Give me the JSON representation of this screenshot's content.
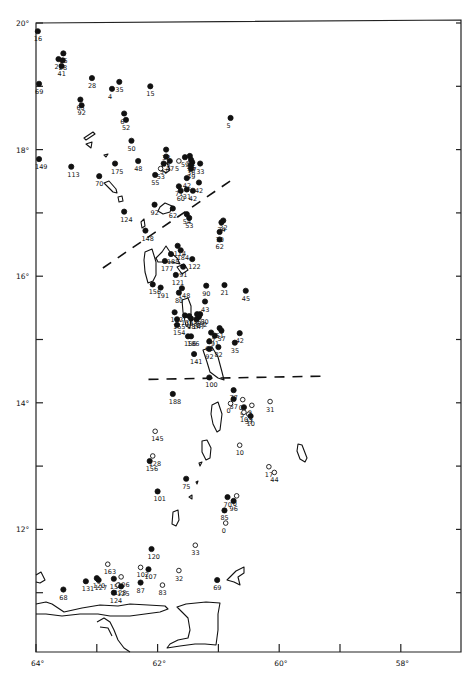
{
  "chart_data": {
    "type": "scatter",
    "title": "",
    "xlabel": "",
    "ylabel": "",
    "xlim": [
      -64,
      -57.1
    ],
    "ylim": [
      10.0,
      20.0
    ],
    "x_ticks": [
      -64,
      -63,
      -62,
      -61,
      -60,
      -59,
      -58
    ],
    "x_tick_labels": [
      {
        "value": -64,
        "label": "64°"
      },
      {
        "value": -62,
        "label": "62°"
      },
      {
        "value": -60,
        "label": "60°"
      },
      {
        "value": -58,
        "label": "58°"
      }
    ],
    "y_ticks": [
      20,
      19,
      18,
      17,
      16,
      15,
      14,
      13,
      12,
      11
    ],
    "y_tick_labels": [
      {
        "value": 20,
        "label": "20°"
      },
      {
        "value": 18,
        "label": "18°"
      },
      {
        "value": 16,
        "label": "16°"
      },
      {
        "value": 14,
        "label": "14°"
      },
      {
        "value": 12,
        "label": "12°"
      }
    ],
    "legend": [
      {
        "marker": "filled-circle",
        "label": ""
      },
      {
        "marker": "open-circle",
        "label": ""
      }
    ],
    "boundaries": [
      {
        "name": "northern-boundary",
        "style": "dashed",
        "points": [
          [
            -62.9,
            16.13
          ],
          [
            -60.75,
            17.54
          ]
        ]
      },
      {
        "name": "southern-boundary",
        "style": "dashed",
        "points": [
          [
            -62.15,
            14.37
          ],
          [
            -59.3,
            14.42
          ]
        ]
      }
    ],
    "points": [
      {
        "lon": -63.97,
        "lat": 19.87,
        "label": "16",
        "filled": true
      },
      {
        "lon": -63.55,
        "lat": 19.52,
        "label": "65",
        "filled": true
      },
      {
        "lon": -63.63,
        "lat": 19.43,
        "label": "27",
        "filled": true
      },
      {
        "lon": -63.56,
        "lat": 19.41,
        "label": "28",
        "filled": true
      },
      {
        "lon": -63.58,
        "lat": 19.32,
        "label": "41",
        "filled": true
      },
      {
        "lon": -63.95,
        "lat": 19.04,
        "label": "69",
        "filled": true
      },
      {
        "lon": -63.08,
        "lat": 19.13,
        "label": "28",
        "filled": true
      },
      {
        "lon": -62.63,
        "lat": 19.07,
        "label": "35",
        "filled": true
      },
      {
        "lon": -62.75,
        "lat": 18.96,
        "label": "4",
        "filled": true
      },
      {
        "lon": -62.12,
        "lat": 19.0,
        "label": "15",
        "filled": true
      },
      {
        "lon": -63.27,
        "lat": 18.79,
        "label": "65",
        "filled": true
      },
      {
        "lon": -63.25,
        "lat": 18.7,
        "label": "92",
        "filled": true
      },
      {
        "lon": -62.55,
        "lat": 18.57,
        "label": "6",
        "filled": true
      },
      {
        "lon": -62.52,
        "lat": 18.47,
        "label": "52",
        "filled": true
      },
      {
        "lon": -60.8,
        "lat": 18.5,
        "label": "5",
        "filled": true
      },
      {
        "lon": -62.43,
        "lat": 18.14,
        "label": "50",
        "filled": true
      },
      {
        "lon": -63.95,
        "lat": 17.85,
        "label": "149",
        "filled": true
      },
      {
        "lon": -63.42,
        "lat": 17.73,
        "label": "113",
        "filled": true
      },
      {
        "lon": -62.96,
        "lat": 17.58,
        "label": "70",
        "filled": true
      },
      {
        "lon": -62.7,
        "lat": 17.78,
        "label": "175",
        "filled": true
      },
      {
        "lon": -62.32,
        "lat": 17.82,
        "label": "48",
        "filled": true
      },
      {
        "lon": -62.04,
        "lat": 17.6,
        "label": "55",
        "filled": true
      },
      {
        "lon": -61.86,
        "lat": 18.0,
        "label": "38",
        "filled": true
      },
      {
        "lon": -61.86,
        "lat": 17.89,
        "label": "45",
        "filled": true
      },
      {
        "lon": -61.9,
        "lat": 17.78,
        "label": "57",
        "filled": true
      },
      {
        "lon": -61.8,
        "lat": 17.82,
        "label": "47",
        "filled": true
      },
      {
        "lon": -61.95,
        "lat": 17.7,
        "label": "53",
        "filled": false
      },
      {
        "lon": -61.65,
        "lat": 17.82,
        "label": "5",
        "filled": false
      },
      {
        "lon": -61.55,
        "lat": 17.88,
        "label": "59",
        "filled": true
      },
      {
        "lon": -61.47,
        "lat": 17.9,
        "label": "33",
        "filled": true
      },
      {
        "lon": -61.45,
        "lat": 17.84,
        "label": "46",
        "filled": true
      },
      {
        "lon": -61.43,
        "lat": 17.8,
        "label": "27",
        "filled": true
      },
      {
        "lon": -61.45,
        "lat": 17.75,
        "label": "36",
        "filled": true
      },
      {
        "lon": -61.45,
        "lat": 17.7,
        "label": "49",
        "filled": true
      },
      {
        "lon": -61.3,
        "lat": 17.78,
        "label": "33",
        "filled": true
      },
      {
        "lon": -61.52,
        "lat": 17.55,
        "label": "42",
        "filled": true
      },
      {
        "lon": -61.65,
        "lat": 17.42,
        "label": "71",
        "filled": true
      },
      {
        "lon": -61.62,
        "lat": 17.35,
        "label": "60",
        "filled": true
      },
      {
        "lon": -61.52,
        "lat": 17.37,
        "label": "31",
        "filled": true
      },
      {
        "lon": -61.42,
        "lat": 17.35,
        "label": "42",
        "filled": true
      },
      {
        "lon": -61.32,
        "lat": 17.48,
        "label": "42",
        "filled": true
      },
      {
        "lon": -62.55,
        "lat": 17.02,
        "label": "124",
        "filled": true
      },
      {
        "lon": -62.05,
        "lat": 17.13,
        "label": "92",
        "filled": true
      },
      {
        "lon": -61.75,
        "lat": 17.07,
        "label": "62",
        "filled": true
      },
      {
        "lon": -61.52,
        "lat": 16.98,
        "label": "54",
        "filled": true
      },
      {
        "lon": -61.48,
        "lat": 16.92,
        "label": "53",
        "filled": true
      },
      {
        "lon": -60.92,
        "lat": 16.88,
        "label": "32",
        "filled": true
      },
      {
        "lon": -60.95,
        "lat": 16.85,
        "label": "24",
        "filled": true
      },
      {
        "lon": -60.98,
        "lat": 16.7,
        "label": "70",
        "filled": true
      },
      {
        "lon": -60.98,
        "lat": 16.58,
        "label": "62",
        "filled": true
      },
      {
        "lon": -62.2,
        "lat": 16.72,
        "label": "148",
        "filled": true
      },
      {
        "lon": -61.67,
        "lat": 16.48,
        "label": "114",
        "filled": true
      },
      {
        "lon": -61.62,
        "lat": 16.41,
        "label": "184",
        "filled": true
      },
      {
        "lon": -61.78,
        "lat": 16.35,
        "label": "185",
        "filled": true
      },
      {
        "lon": -61.88,
        "lat": 16.24,
        "label": "177",
        "filled": true
      },
      {
        "lon": -61.43,
        "lat": 16.27,
        "label": "122",
        "filled": true
      },
      {
        "lon": -61.58,
        "lat": 16.15,
        "label": "91",
        "filled": true
      },
      {
        "lon": -61.7,
        "lat": 16.02,
        "label": "121",
        "filled": true
      },
      {
        "lon": -62.08,
        "lat": 15.87,
        "label": "156",
        "filled": true
      },
      {
        "lon": -61.95,
        "lat": 15.82,
        "label": "191",
        "filled": true
      },
      {
        "lon": -61.6,
        "lat": 15.81,
        "label": "148",
        "filled": true
      },
      {
        "lon": -61.65,
        "lat": 15.74,
        "label": "80",
        "filled": true
      },
      {
        "lon": -61.2,
        "lat": 15.85,
        "label": "90",
        "filled": true
      },
      {
        "lon": -60.9,
        "lat": 15.86,
        "label": "21",
        "filled": true
      },
      {
        "lon": -60.55,
        "lat": 15.77,
        "label": "45",
        "filled": true
      },
      {
        "lon": -61.22,
        "lat": 15.6,
        "label": "43",
        "filled": true
      },
      {
        "lon": -61.72,
        "lat": 15.43,
        "label": "152",
        "filled": true
      },
      {
        "lon": -61.55,
        "lat": 15.38,
        "label": "135",
        "filled": true
      },
      {
        "lon": -61.48,
        "lat": 15.37,
        "label": "153",
        "filled": true
      },
      {
        "lon": -61.35,
        "lat": 15.4,
        "label": "151",
        "filled": true
      },
      {
        "lon": -61.3,
        "lat": 15.4,
        "label": "150",
        "filled": true
      },
      {
        "lon": -61.32,
        "lat": 15.36,
        "label": "162",
        "filled": true
      },
      {
        "lon": -61.68,
        "lat": 15.32,
        "label": "155",
        "filled": true
      },
      {
        "lon": -61.68,
        "lat": 15.23,
        "label": "154",
        "filled": true
      },
      {
        "lon": -61.45,
        "lat": 15.33,
        "label": "187",
        "filled": true
      },
      {
        "lon": -61.36,
        "lat": 15.32,
        "label": "147",
        "filled": true
      },
      {
        "lon": -61.5,
        "lat": 15.05,
        "label": "156",
        "filled": true
      },
      {
        "lon": -60.98,
        "lat": 15.18,
        "label": "61",
        "filled": true
      },
      {
        "lon": -60.95,
        "lat": 15.14,
        "label": "57",
        "filled": true
      },
      {
        "lon": -61.12,
        "lat": 15.11,
        "label": "67",
        "filled": true
      },
      {
        "lon": -61.06,
        "lat": 15.06,
        "label": "91",
        "filled": true
      },
      {
        "lon": -61.15,
        "lat": 14.97,
        "label": "65",
        "filled": true
      },
      {
        "lon": -61.15,
        "lat": 14.85,
        "label": "92",
        "filled": true
      },
      {
        "lon": -61.0,
        "lat": 14.88,
        "label": "82",
        "filled": true
      },
      {
        "lon": -60.65,
        "lat": 15.1,
        "label": "42",
        "filled": true
      },
      {
        "lon": -60.73,
        "lat": 14.95,
        "label": "35",
        "filled": true
      },
      {
        "lon": -61.45,
        "lat": 15.05,
        "label": "186",
        "filled": true
      },
      {
        "lon": -61.4,
        "lat": 14.77,
        "label": "141",
        "filled": true
      },
      {
        "lon": -61.15,
        "lat": 14.4,
        "label": "100",
        "filled": true
      },
      {
        "lon": -61.75,
        "lat": 14.14,
        "label": "188",
        "filled": true
      },
      {
        "lon": -60.75,
        "lat": 14.2,
        "label": "77",
        "filled": true
      },
      {
        "lon": -60.75,
        "lat": 14.06,
        "label": "87",
        "filled": true
      },
      {
        "lon": -60.8,
        "lat": 13.99,
        "label": "0",
        "filled": false
      },
      {
        "lon": -60.6,
        "lat": 14.05,
        "label": "0",
        "filled": false
      },
      {
        "lon": -60.58,
        "lat": 13.93,
        "label": "5",
        "filled": true
      },
      {
        "lon": -60.45,
        "lat": 13.96,
        "label": "0",
        "filled": false
      },
      {
        "lon": -60.58,
        "lat": 13.85,
        "label": "103",
        "filled": false
      },
      {
        "lon": -60.5,
        "lat": 13.82,
        "label": "37",
        "filled": false
      },
      {
        "lon": -60.47,
        "lat": 13.79,
        "label": "10",
        "filled": true
      },
      {
        "lon": -60.15,
        "lat": 14.02,
        "label": "31",
        "filled": false
      },
      {
        "lon": -62.04,
        "lat": 13.55,
        "label": "145",
        "filled": false
      },
      {
        "lon": -60.65,
        "lat": 13.33,
        "label": "10",
        "filled": false
      },
      {
        "lon": -62.08,
        "lat": 13.16,
        "label": "128",
        "filled": false
      },
      {
        "lon": -62.13,
        "lat": 13.08,
        "label": "156",
        "filled": true
      },
      {
        "lon": -60.17,
        "lat": 12.99,
        "label": "17",
        "filled": false
      },
      {
        "lon": -60.08,
        "lat": 12.9,
        "label": "44",
        "filled": false
      },
      {
        "lon": -61.53,
        "lat": 12.8,
        "label": "75",
        "filled": true
      },
      {
        "lon": -62.0,
        "lat": 12.6,
        "label": "101",
        "filled": true
      },
      {
        "lon": -60.85,
        "lat": 12.51,
        "label": "70",
        "filled": true
      },
      {
        "lon": -60.75,
        "lat": 12.45,
        "label": "96",
        "filled": true
      },
      {
        "lon": -60.7,
        "lat": 12.53,
        "label": "0",
        "filled": false
      },
      {
        "lon": -60.9,
        "lat": 12.3,
        "label": "85",
        "filled": true
      },
      {
        "lon": -60.88,
        "lat": 12.1,
        "label": "0",
        "filled": false
      },
      {
        "lon": -62.1,
        "lat": 11.69,
        "label": "120",
        "filled": true
      },
      {
        "lon": -61.38,
        "lat": 11.75,
        "label": "33",
        "filled": false
      },
      {
        "lon": -62.82,
        "lat": 11.45,
        "label": "163",
        "filled": false
      },
      {
        "lon": -62.28,
        "lat": 11.4,
        "label": "102",
        "filled": false
      },
      {
        "lon": -62.15,
        "lat": 11.37,
        "label": "107",
        "filled": true
      },
      {
        "lon": -61.65,
        "lat": 11.35,
        "label": "32",
        "filled": false
      },
      {
        "lon": -61.02,
        "lat": 11.2,
        "label": "69",
        "filled": true
      },
      {
        "lon": -63.0,
        "lat": 11.23,
        "label": "120",
        "filled": true
      },
      {
        "lon": -62.97,
        "lat": 11.2,
        "label": "127",
        "filled": true
      },
      {
        "lon": -63.18,
        "lat": 11.18,
        "label": "131",
        "filled": true
      },
      {
        "lon": -62.72,
        "lat": 11.22,
        "label": "154",
        "filled": true
      },
      {
        "lon": -62.6,
        "lat": 11.25,
        "label": "106",
        "filled": false
      },
      {
        "lon": -62.65,
        "lat": 11.12,
        "label": "128",
        "filled": false
      },
      {
        "lon": -62.6,
        "lat": 11.1,
        "label": "125",
        "filled": true
      },
      {
        "lon": -62.72,
        "lat": 11.0,
        "label": "124",
        "filled": true
      },
      {
        "lon": -62.28,
        "lat": 11.16,
        "label": "87",
        "filled": true
      },
      {
        "lon": -61.92,
        "lat": 11.12,
        "label": "83",
        "filled": false
      },
      {
        "lon": -63.55,
        "lat": 11.05,
        "label": "68",
        "filled": true
      }
    ]
  }
}
